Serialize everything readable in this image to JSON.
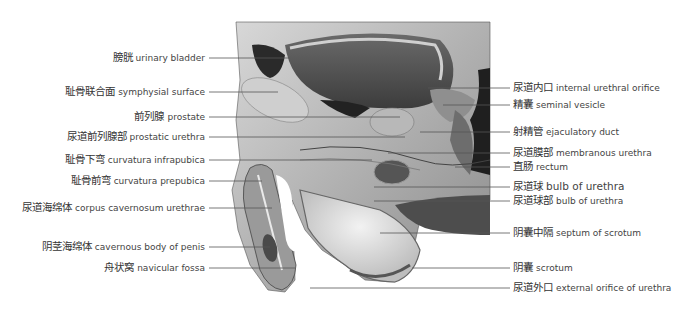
{
  "figure": {
    "image_region": {
      "x": 232,
      "y": 22,
      "width": 258,
      "height": 268
    },
    "line_color": "#555555"
  },
  "labels_left": [
    {
      "zh": "膀胱",
      "en": "urinary bladder",
      "y": 58,
      "line_to_x": 290
    },
    {
      "zh": "耻骨联合面",
      "en": "symphysial surface",
      "y": 92,
      "line_to_x": 278
    },
    {
      "zh": "前列腺",
      "en": "prostate",
      "y": 117,
      "line_to_x": 400
    },
    {
      "zh": "尿道前列腺部",
      "en": "prostatic urethra",
      "y": 137,
      "line_to_x": 405
    },
    {
      "zh": "耻骨下弯",
      "en": "curvatura infrapubica",
      "y": 160,
      "line_to_x": 372
    },
    {
      "zh": "耻骨前弯",
      "en": "curvatura prepubica",
      "y": 181,
      "line_to_x": 262
    },
    {
      "zh": "尿道海绵体",
      "en": "corpus cavernosum urethrae",
      "y": 208,
      "line_to_x": 272
    },
    {
      "zh": "阴茎海绵体",
      "en": "cavernous body of penis",
      "y": 247,
      "line_to_x": 270
    },
    {
      "zh": "舟状窝",
      "en": "navicular fossa",
      "y": 268,
      "line_to_x": 295
    }
  ],
  "labels_right": [
    {
      "zh": "尿道内口",
      "en": "internal urethral orifice",
      "y": 88,
      "line_from_x": 428
    },
    {
      "zh": "精囊",
      "en": "seminal vesicle",
      "y": 105,
      "line_from_x": 443
    },
    {
      "zh": "射精管",
      "en": "ejaculatory duct",
      "y": 132,
      "line_from_x": 420
    },
    {
      "zh": "尿道膜部",
      "en": "membranous urethra",
      "y": 153,
      "line_from_x": 388
    },
    {
      "zh": "直肠",
      "en": "rectum",
      "y": 167,
      "line_from_x": 455
    },
    {
      "zh": "尿道球",
      "en": "bulb of urethra",
      "y": 187,
      "line_from_x": 374,
      "emphasis": true
    },
    {
      "zh": "尿道球部",
      "en": "bulb of urethra",
      "y": 201,
      "line_from_x": 374
    },
    {
      "zh": "阴囊中隔",
      "en": "septum of scrotum",
      "y": 233,
      "line_from_x": 380
    },
    {
      "zh": "阴囊",
      "en": "scrotum",
      "y": 268,
      "line_from_x": 412
    },
    {
      "zh": "尿道外口",
      "en": "external orifice of urethra",
      "y": 288,
      "line_from_x": 310
    }
  ]
}
